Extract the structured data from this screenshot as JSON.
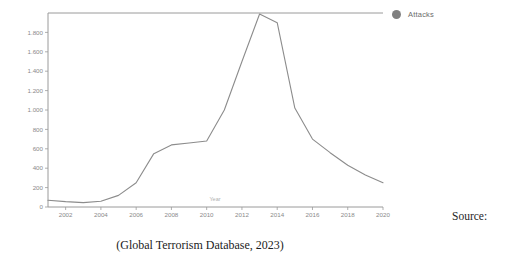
{
  "chart_data": {
    "type": "line",
    "title": "",
    "xlabel": "Year",
    "ylabel": "",
    "xlim": [
      2001,
      2020
    ],
    "ylim": [
      0,
      2000
    ],
    "grid": false,
    "legend_position": "right",
    "series": [
      {
        "name": "Attacks",
        "color": "#8c8c8c",
        "x": [
          2001,
          2002,
          2003,
          2004,
          2005,
          2006,
          2007,
          2008,
          2009,
          2010,
          2011,
          2012,
          2013,
          2014,
          2015,
          2016,
          2017,
          2018,
          2019,
          2020
        ],
        "values": [
          70,
          55,
          45,
          60,
          120,
          250,
          550,
          640,
          660,
          680,
          1000,
          1500,
          1990,
          1900,
          1020,
          700,
          560,
          430,
          330,
          250
        ]
      }
    ],
    "x_ticks": [
      "2002",
      "2004",
      "2006",
      "2008",
      "2010",
      "2012",
      "2014",
      "2016",
      "2018",
      "2020"
    ],
    "x_tick_values": [
      2002,
      2004,
      2006,
      2008,
      2010,
      2012,
      2014,
      2016,
      2018,
      2020
    ],
    "y_ticks": [
      "0",
      "200",
      "400",
      "600",
      "800",
      "1.000",
      "1.200",
      "1.400",
      "1.600",
      "1.800"
    ],
    "y_tick_values": [
      0,
      200,
      400,
      600,
      800,
      1000,
      1200,
      1400,
      1600,
      1800
    ]
  },
  "legend": {
    "items": [
      {
        "label": "Attacks",
        "color": "#808080"
      }
    ]
  },
  "caption": {
    "text": "(Global Terrorism Database, 2023)"
  },
  "source": {
    "label": "Source:"
  },
  "colors": {
    "line": "#8c8c8c",
    "axis": "#9a9a9a",
    "tick_text": "#8a8a8a",
    "caption_text": "#1c1c1c"
  }
}
